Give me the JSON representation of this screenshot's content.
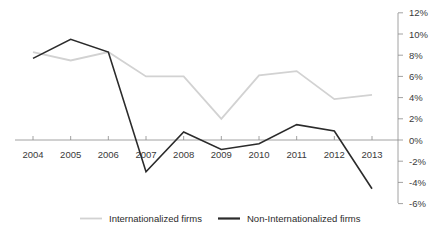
{
  "chart_data": {
    "type": "line",
    "title": "",
    "subtitle": "",
    "xlabel": "",
    "ylabel": "",
    "categories": [
      "2004",
      "2005",
      "2006",
      "2007",
      "2008",
      "2009",
      "2010",
      "2011",
      "2012",
      "2013"
    ],
    "x": [
      2004,
      2005,
      2006,
      2007,
      2008,
      2009,
      2010,
      2011,
      2012,
      2013
    ],
    "ylim": [
      -6,
      12
    ],
    "y_ticks": [
      12,
      10,
      8,
      6,
      4,
      2,
      0,
      -2,
      -4,
      -6
    ],
    "y_tick_labels": [
      "12%",
      "10%",
      "8%",
      "6%",
      "4%",
      "2%",
      "0%",
      "-2%",
      "-4%",
      "-6%"
    ],
    "y_axis_position": "right",
    "grid": false,
    "legend_position": "bottom",
    "series": [
      {
        "name": "Internationalized firms",
        "color": "#d2d2d2",
        "width": 1.8,
        "values": [
          8.3,
          7.5,
          8.3,
          6.0,
          6.0,
          2.0,
          6.1,
          6.5,
          3.85,
          4.25
        ]
      },
      {
        "name": "Non-Internationalized firms",
        "color": "#2b2b2b",
        "width": 1.6,
        "values": [
          7.7,
          9.5,
          8.3,
          -3.0,
          0.75,
          -0.9,
          -0.35,
          1.45,
          0.85,
          -4.6
        ]
      }
    ]
  },
  "legend": {
    "items": [
      {
        "label": "Internationalized firms",
        "color": "#d2d2d2"
      },
      {
        "label": "Non-Internationalized firms",
        "color": "#2b2b2b"
      }
    ]
  },
  "axes": {
    "x_tick_labels": [
      "2004",
      "2005",
      "2006",
      "2007",
      "2008",
      "2009",
      "2010",
      "2011",
      "2012",
      "2013"
    ],
    "y_tick_labels": [
      "12%",
      "10%",
      "8%",
      "6%",
      "4%",
      "2%",
      "0%",
      "-2%",
      "-4%",
      "-6%"
    ]
  },
  "colors": {
    "axis": "#8a8a8a",
    "text": "#3a3a3a",
    "series_light": "#d2d2d2",
    "series_dark": "#2b2b2b",
    "background": "#ffffff"
  }
}
